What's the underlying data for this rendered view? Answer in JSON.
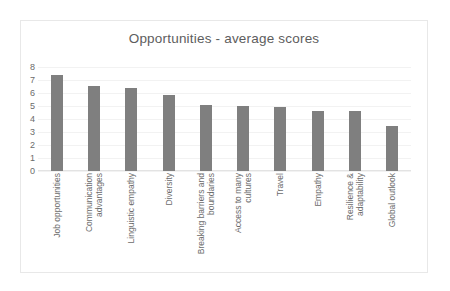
{
  "chart_data": {
    "type": "bar",
    "title": "Opportunities - average scores",
    "xlabel": "",
    "ylabel": "",
    "ylim": [
      0,
      8
    ],
    "y_ticks": [
      "8",
      "7",
      "6",
      "5",
      "4",
      "3",
      "2",
      "1",
      "0"
    ],
    "grid": true,
    "legend": "none",
    "bar_color": "#7f7f7f",
    "categories": [
      "Job opportunities",
      "Communication advantages",
      "Linguistic empathy",
      "Diversity",
      "Breaking barriers and boundaries",
      "Access to many cultures",
      "Travel",
      "Empathy",
      "Resilience & adaptability",
      "Global outlook"
    ],
    "category_lines": [
      [
        "Job opportunities"
      ],
      [
        "Communication",
        "advantages"
      ],
      [
        "Linguistic empathy"
      ],
      [
        "Diversity"
      ],
      [
        "Breaking barriers and",
        "boundaries"
      ],
      [
        "Access to many",
        "cultures"
      ],
      [
        "Travel"
      ],
      [
        "Empathy"
      ],
      [
        "Resilience &",
        "adaptability"
      ],
      [
        "Global outlook"
      ]
    ],
    "values": [
      7.4,
      6.55,
      6.4,
      5.85,
      5.05,
      5.0,
      4.9,
      4.65,
      4.6,
      3.5
    ]
  }
}
